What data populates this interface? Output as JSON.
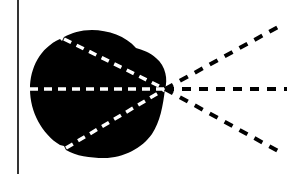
{
  "diagram": {
    "background": "#ffffff",
    "foreground": "#000000",
    "vertical_line": {
      "x": 18,
      "y1": 0,
      "y2": 174,
      "color": "#000000"
    },
    "blob": {
      "color": "#000000",
      "path": "M 165 89 C 168 80, 166 66, 156 58 C 150 52, 142 50, 136 48 C 126 36, 108 30, 92 30 C 80 30, 72 33, 64 37 L 62 41 L 60 39 C 40 48, 30 68, 30 89 C 30 112, 42 134, 60 145 L 64 146 L 66 150 C 76 156, 90 158, 104 158 C 124 158, 142 148, 152 134 C 160 122, 163 106, 165 89 Z"
    },
    "focal_point": {
      "x": 165,
      "y": 89
    },
    "inner_rays": {
      "color": "#ffffff",
      "dash": "8 6",
      "width": 3.5,
      "lines": [
        {
          "name": "inner-ray-upper",
          "x1": 64,
          "y1": 39,
          "x2": 165,
          "y2": 89
        },
        {
          "name": "inner-ray-middle",
          "x1": 30,
          "y1": 89,
          "x2": 165,
          "y2": 89
        },
        {
          "name": "inner-ray-lower",
          "x1": 66,
          "y1": 148,
          "x2": 165,
          "y2": 89
        }
      ]
    },
    "outer_rays": {
      "color": "#000000",
      "dash": "9 8",
      "width": 4,
      "lines": [
        {
          "name": "outer-ray-upper",
          "x1": 165,
          "y1": 89,
          "x2": 278,
          "y2": 27
        },
        {
          "name": "outer-ray-middle",
          "x1": 165,
          "y1": 89,
          "x2": 287,
          "y2": 89
        },
        {
          "name": "outer-ray-lower",
          "x1": 165,
          "y1": 89,
          "x2": 278,
          "y2": 151
        }
      ]
    }
  }
}
